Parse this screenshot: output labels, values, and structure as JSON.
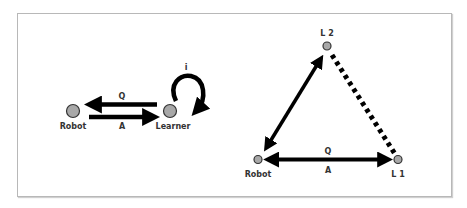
{
  "colors": {
    "node_fill": "#a8a8a8",
    "node_stroke": "#333333",
    "arrow": "#000000",
    "frame": "#b8b8b8"
  },
  "left_diagram": {
    "nodes": [
      {
        "id": "robot",
        "label": "Robot"
      },
      {
        "id": "learner",
        "label": "Learner"
      }
    ],
    "edges": [
      {
        "from": "learner",
        "to": "robot",
        "label": "Q"
      },
      {
        "from": "robot",
        "to": "learner",
        "label": "A"
      },
      {
        "from": "learner",
        "to": "learner",
        "label": "i",
        "type": "self-loop"
      }
    ]
  },
  "right_diagram": {
    "nodes": [
      {
        "id": "l2",
        "label": "L 2"
      },
      {
        "id": "robot",
        "label": "Robot"
      },
      {
        "id": "l1",
        "label": "L 1"
      }
    ],
    "edges": [
      {
        "from": "robot",
        "to": "l2",
        "type": "bidirectional",
        "style": "solid"
      },
      {
        "from": "robot",
        "to": "l1",
        "type": "bidirectional",
        "style": "solid",
        "label_top": "Q",
        "label_bottom": "A"
      },
      {
        "from": "l2",
        "to": "l1",
        "type": "line",
        "style": "dotted"
      }
    ]
  }
}
